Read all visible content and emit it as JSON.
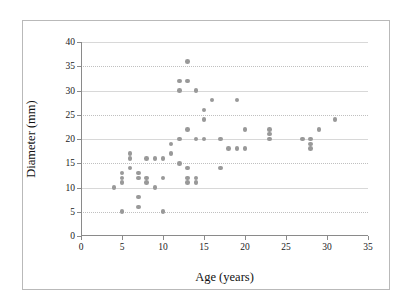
{
  "chart_data": {
    "type": "scatter",
    "title": "",
    "xlabel": "Age (years)",
    "ylabel": "Diameter (mm)",
    "xlim": [
      0,
      35
    ],
    "ylim": [
      0,
      40
    ],
    "xticks": [
      0,
      5,
      10,
      15,
      20,
      25,
      30,
      35
    ],
    "yticks": [
      0,
      5,
      10,
      15,
      20,
      25,
      30,
      35,
      40
    ],
    "grid": "horizontal-dotted",
    "legend": null,
    "marker_color": "#999999",
    "points": [
      {
        "x": 4,
        "y": 10
      },
      {
        "x": 5,
        "y": 5
      },
      {
        "x": 5,
        "y": 11
      },
      {
        "x": 5,
        "y": 12
      },
      {
        "x": 5,
        "y": 13
      },
      {
        "x": 6,
        "y": 14
      },
      {
        "x": 6,
        "y": 16
      },
      {
        "x": 6,
        "y": 17
      },
      {
        "x": 7,
        "y": 6
      },
      {
        "x": 7,
        "y": 8
      },
      {
        "x": 7,
        "y": 12
      },
      {
        "x": 7,
        "y": 13
      },
      {
        "x": 8,
        "y": 11
      },
      {
        "x": 8,
        "y": 12
      },
      {
        "x": 8,
        "y": 16
      },
      {
        "x": 9,
        "y": 10
      },
      {
        "x": 9,
        "y": 16
      },
      {
        "x": 10,
        "y": 5
      },
      {
        "x": 10,
        "y": 12
      },
      {
        "x": 10,
        "y": 16
      },
      {
        "x": 11,
        "y": 17
      },
      {
        "x": 11,
        "y": 19
      },
      {
        "x": 12,
        "y": 15
      },
      {
        "x": 12,
        "y": 20
      },
      {
        "x": 12,
        "y": 30
      },
      {
        "x": 12,
        "y": 32
      },
      {
        "x": 13,
        "y": 11
      },
      {
        "x": 13,
        "y": 12
      },
      {
        "x": 13,
        "y": 14
      },
      {
        "x": 13,
        "y": 22
      },
      {
        "x": 13,
        "y": 32
      },
      {
        "x": 13,
        "y": 36
      },
      {
        "x": 14,
        "y": 11
      },
      {
        "x": 14,
        "y": 12
      },
      {
        "x": 14,
        "y": 20
      },
      {
        "x": 14,
        "y": 30
      },
      {
        "x": 15,
        "y": 20
      },
      {
        "x": 15,
        "y": 24
      },
      {
        "x": 15,
        "y": 26
      },
      {
        "x": 16,
        "y": 28
      },
      {
        "x": 17,
        "y": 14
      },
      {
        "x": 17,
        "y": 20
      },
      {
        "x": 18,
        "y": 18
      },
      {
        "x": 19,
        "y": 18
      },
      {
        "x": 19,
        "y": 28
      },
      {
        "x": 20,
        "y": 18
      },
      {
        "x": 20,
        "y": 22
      },
      {
        "x": 23,
        "y": 20
      },
      {
        "x": 23,
        "y": 21
      },
      {
        "x": 23,
        "y": 22
      },
      {
        "x": 27,
        "y": 20
      },
      {
        "x": 28,
        "y": 18
      },
      {
        "x": 28,
        "y": 19
      },
      {
        "x": 28,
        "y": 20
      },
      {
        "x": 29,
        "y": 22
      },
      {
        "x": 31,
        "y": 24
      }
    ]
  }
}
